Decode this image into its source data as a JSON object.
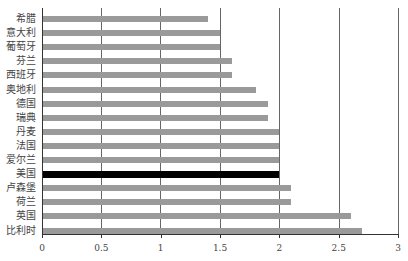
{
  "chart_data": {
    "type": "bar",
    "orientation": "horizontal",
    "title": "",
    "xlabel": "",
    "ylabel": "",
    "xlim": [
      0,
      3
    ],
    "x_ticks": [
      "0",
      "0.5",
      "1",
      "1.5",
      "2",
      "2.5",
      "3"
    ],
    "grid": "vertical",
    "categories": [
      "希腊",
      "意大利",
      "葡萄牙",
      "芬兰",
      "西班牙",
      "奥地利",
      "德国",
      "瑞典",
      "丹麦",
      "法国",
      "爱尔兰",
      "美国",
      "卢森堡",
      "荷兰",
      "英国",
      "比利时"
    ],
    "values": [
      1.4,
      1.5,
      1.5,
      1.6,
      1.6,
      1.8,
      1.9,
      1.9,
      2.0,
      2.0,
      2.0,
      2.0,
      2.1,
      2.1,
      2.6,
      2.7
    ],
    "highlight": "美国",
    "colors": {
      "bar": "#9a9a9a",
      "highlight": "#000000"
    }
  }
}
